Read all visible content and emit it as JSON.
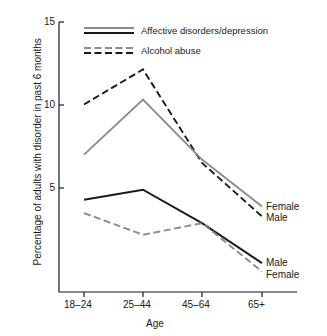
{
  "chart_data": {
    "type": "line",
    "title": "",
    "xlabel": "Age",
    "ylabel": "Percentage of adults with disorder in past 6 months",
    "categories": [
      "18–24",
      "25–44",
      "45–64",
      "65+"
    ],
    "yticks": [
      5,
      10,
      15
    ],
    "ylim": [
      0,
      15
    ],
    "grid": false,
    "legend_position": "top-center",
    "legend": [
      {
        "label": "Affective disorders/depression",
        "style": "solid",
        "colors": [
          "#8c8c8c",
          "#1a1a1a"
        ]
      },
      {
        "label": "Alcohol abuse",
        "style": "dashed",
        "colors": [
          "#8c8c8c",
          "#1a1a1a"
        ]
      }
    ],
    "series": [
      {
        "name": "Alcohol abuse – Male",
        "group": "Alcohol abuse",
        "sex": "Male",
        "style": "dashed",
        "color": "#1a1a1a",
        "values": [
          10.0,
          12.1,
          6.5,
          3.3
        ],
        "end_label": "Male"
      },
      {
        "name": "Alcohol abuse – Female",
        "group": "Alcohol abuse",
        "sex": "Female",
        "style": "dashed",
        "color": "#8c8c8c",
        "values": [
          3.5,
          2.2,
          2.9,
          0.0
        ],
        "end_label": "Female"
      },
      {
        "name": "Affective disorders/depression – Female",
        "group": "Affective disorders/depression",
        "sex": "Female",
        "style": "solid",
        "color": "#8c8c8c",
        "values": [
          7.0,
          10.3,
          6.7,
          3.9
        ],
        "end_label": "Female"
      },
      {
        "name": "Affective disorders/depression – Male",
        "group": "Affective disorders/depression",
        "sex": "Male",
        "style": "solid",
        "color": "#1a1a1a",
        "values": [
          4.3,
          4.9,
          2.9,
          0.5
        ],
        "end_label": "Male"
      }
    ],
    "end_labels": [
      {
        "text": "Female",
        "series": "Affective disorders/depression – Female"
      },
      {
        "text": "Male",
        "series": "Alcohol abuse – Male"
      },
      {
        "text": "Male",
        "series": "Affective disorders/depression – Male"
      },
      {
        "text": "Female",
        "series": "Alcohol abuse – Female"
      }
    ]
  },
  "axes": {
    "y_tick_labels": [
      "15",
      "10",
      "5"
    ],
    "x_tick_labels": [
      "18–24",
      "25–44",
      "45–64",
      "65+"
    ],
    "x_title": "Age",
    "y_title": "Percentage of adults with disorder in past 6 months"
  },
  "legend": {
    "entry_1": "Affective disorders/depression",
    "entry_2": "Alcohol abuse"
  },
  "labels": {
    "upper_female": "Female",
    "upper_male": "Male",
    "lower_male": "Male",
    "lower_female": "Female"
  },
  "colors": {
    "female": "#8c8c8c",
    "male": "#1a1a1a",
    "axis": "#1a1a1a",
    "background": "#ffffff"
  }
}
